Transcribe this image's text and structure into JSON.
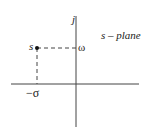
{
  "diagram": {
    "title": "s – plane",
    "imag_axis_label": "j",
    "point_label": "s",
    "imag_coord_label": "ω",
    "real_coord_label": "−σ",
    "colors": {
      "line": "#333333",
      "background": "#ffffff"
    }
  }
}
